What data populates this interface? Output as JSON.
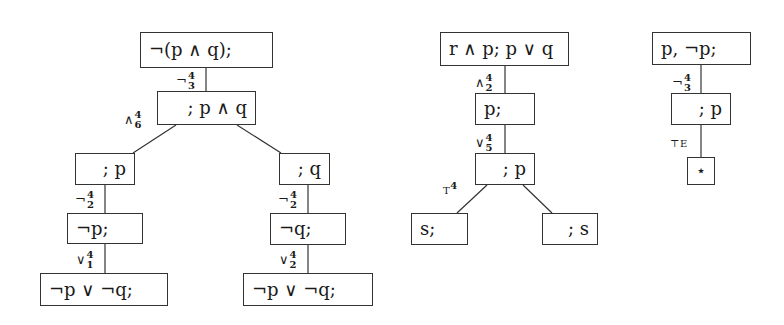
{
  "trees": [
    {
      "name": "tree-1",
      "nodes": [
        {
          "id": "t1-root",
          "text": "¬(p ∧ q);"
        },
        {
          "id": "t1-n2",
          "text": "; p ∧ q"
        },
        {
          "id": "t1-left",
          "text": "; p"
        },
        {
          "id": "t1-right",
          "text": "; q"
        },
        {
          "id": "t1-left-neg",
          "text": "¬p;"
        },
        {
          "id": "t1-right-neg",
          "text": "¬q;"
        },
        {
          "id": "t1-left-or",
          "text": "¬p ∨ ¬q;"
        },
        {
          "id": "t1-right-or",
          "text": "¬p ∨ ¬q;"
        }
      ],
      "edge_labels": [
        {
          "op": "¬",
          "sup": "4",
          "sub": "3"
        },
        {
          "op": "∧",
          "sup": "4",
          "sub": "6"
        },
        {
          "op": "¬",
          "sup": "4",
          "sub": "2"
        },
        {
          "op": "¬",
          "sup": "4",
          "sub": "2"
        },
        {
          "op": "∨",
          "sup": "4",
          "sub": "1"
        },
        {
          "op": "∨",
          "sup": "4",
          "sub": "2"
        }
      ]
    },
    {
      "name": "tree-2",
      "nodes": [
        {
          "id": "t2-root",
          "text": "r ∧ p; p ∨ q"
        },
        {
          "id": "t2-n2",
          "text": "p;"
        },
        {
          "id": "t2-n3",
          "text": "; p"
        },
        {
          "id": "t2-left",
          "text": "s;"
        },
        {
          "id": "t2-right",
          "text": "; s"
        }
      ],
      "edge_labels": [
        {
          "op": "∧",
          "sup": "4",
          "sub": "2"
        },
        {
          "op": "∨",
          "sup": "4",
          "sub": "5"
        },
        {
          "op": "T",
          "sup": "4",
          "sub": ""
        }
      ]
    },
    {
      "name": "tree-3",
      "nodes": [
        {
          "id": "t3-root",
          "text": "p, ¬p;"
        },
        {
          "id": "t3-n2",
          "text": "; p"
        },
        {
          "id": "t3-leaf",
          "text": "⋆"
        }
      ],
      "edge_labels": [
        {
          "op": "¬",
          "sup": "4",
          "sub": "3"
        },
        {
          "op": "⊤E",
          "sup": "",
          "sub": ""
        }
      ]
    }
  ]
}
